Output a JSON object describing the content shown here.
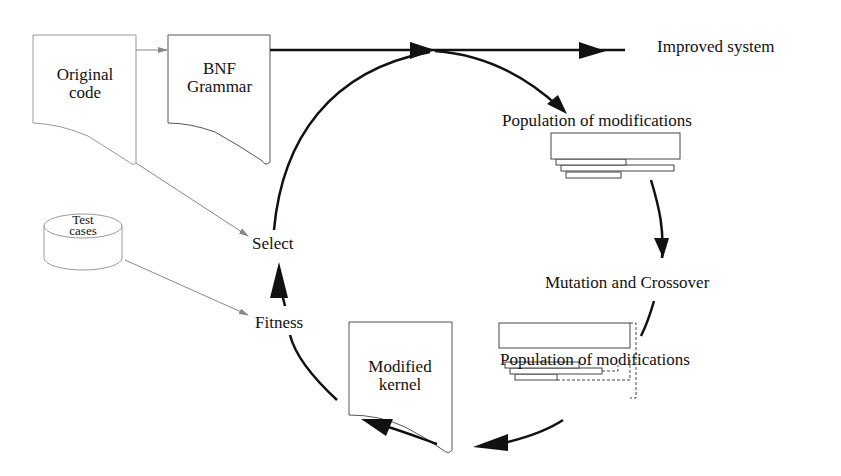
{
  "diagram": {
    "nodes": {
      "original_code": {
        "line1": "Original",
        "line2": "code"
      },
      "bnf_grammar": {
        "line1": "BNF",
        "line2": "Grammar"
      },
      "improved_system": "Improved system",
      "population_top": "Population of modifications",
      "mutation_crossover": "Mutation and Crossover",
      "population_bottom": "Population of modifications",
      "modified_kernel": {
        "line1": "Modified",
        "line2": "kernel"
      },
      "fitness": "Fitness",
      "select": "Select",
      "test_cases": {
        "line1": "Test",
        "line2": "cases"
      }
    },
    "colors": {
      "main_stroke": "#111111",
      "secondary_stroke": "#888888",
      "background": "#ffffff"
    }
  }
}
